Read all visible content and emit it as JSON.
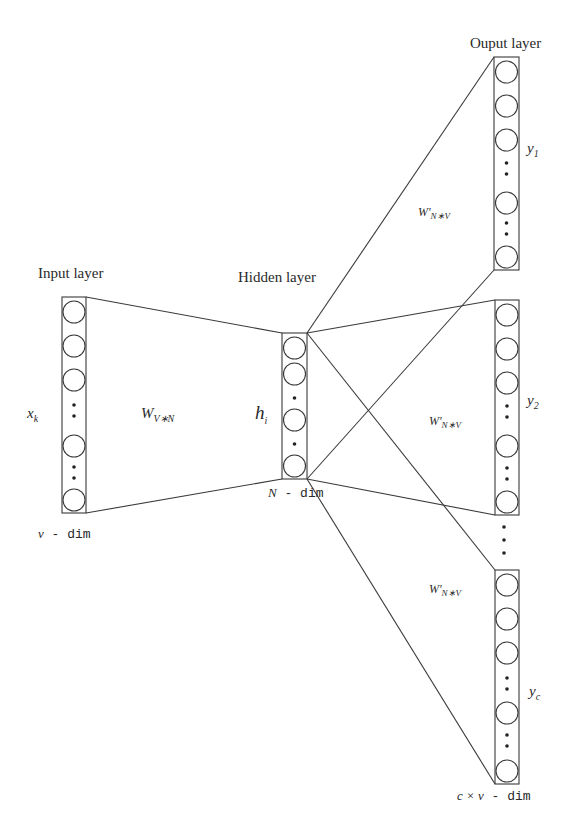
{
  "diagram": {
    "type": "neural-network-architecture",
    "layers": {
      "input": {
        "title": "Input layer",
        "node_label": "x",
        "node_sub": "k",
        "dim_label_var": "v",
        "dim_label": " - dim"
      },
      "hidden": {
        "title": "Hidden layer",
        "node_label": "h",
        "node_sub": "i",
        "dim_label_var": "N",
        "dim_label": " - dim"
      },
      "output": {
        "title": "Ouput layer",
        "dim_label_var": "c × v",
        "dim_label": " - dim"
      }
    },
    "weights": {
      "input_hidden": {
        "base": "W",
        "sub": "V∗N"
      },
      "hidden_output": {
        "base": "W'",
        "sub": "N∗V"
      }
    },
    "outputs": [
      {
        "label": "y",
        "sub": "1"
      },
      {
        "label": "y",
        "sub": "2"
      },
      {
        "label": "y",
        "sub": "c"
      }
    ],
    "colors": {
      "stroke": "#3a3a3a",
      "background": "#ffffff"
    }
  }
}
